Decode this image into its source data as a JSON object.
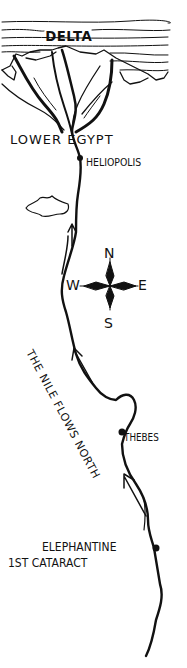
{
  "map": {
    "title": "The Nile in Ancient Egypt",
    "labels": {
      "delta": "DELTA",
      "lower_egypt": "LOWER EGYPT",
      "heliopolis": "HELIOPOLIS",
      "flow_note": "THE NILE FLOWS NORTH",
      "thebes": "THEBES",
      "elephantine": "ELEPHANTINE",
      "cataract": "1ST CATARACT"
    },
    "compass": {
      "north": "N",
      "south": "S",
      "west": "W",
      "east": "E"
    },
    "cities": [
      "Heliopolis",
      "Thebes",
      "Elephantine"
    ],
    "colors": {
      "ink": "#111111",
      "paper": "#ffffff"
    }
  }
}
